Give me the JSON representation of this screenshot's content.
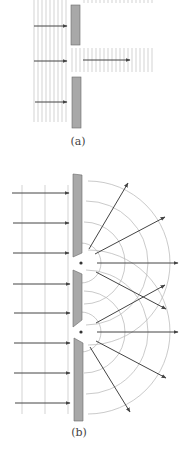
{
  "figure": {
    "panel_a": {
      "label": "(a)",
      "description": "Plane wave passing through a wide slit"
    },
    "panel_b": {
      "label": "(b)",
      "description": "Plane wave diffracting through two narrow slits"
    }
  },
  "colors": {
    "background": "#ffffff",
    "wavefront": "#c8c8c8",
    "arrow": "#444444",
    "barrier_fill": "#a8a8a8",
    "barrier_stroke": "#6a6a6a",
    "arc": "#bdbdbd",
    "dot": "#333333",
    "label": "#444444"
  }
}
